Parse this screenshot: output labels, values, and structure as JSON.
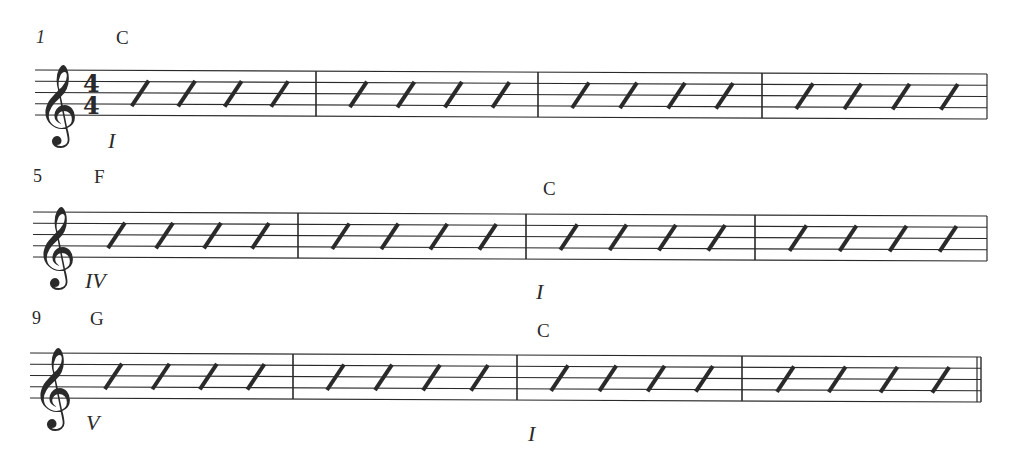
{
  "score": {
    "time_signature": {
      "top": "4",
      "bottom": "4"
    },
    "clef": "treble",
    "notation": "slash",
    "beats_per_measure": 4,
    "ink_color": "#2a2a2a",
    "systems": [
      {
        "measure_number": "1",
        "measure_number_italic": true,
        "show_time_signature": true,
        "staff_top_left": 70,
        "staff_top_right": 74,
        "staff_left": 35,
        "staff_right": 987,
        "barlines": [
          316,
          538,
          762
        ],
        "end_barline": "single",
        "chords": [
          {
            "label": "C",
            "x": 116,
            "y": 28
          }
        ],
        "romans": [
          {
            "label": "I",
            "x": 108,
            "y": 130
          }
        ],
        "measure_number_pos": {
          "x": 36,
          "y": 28
        }
      },
      {
        "measure_number": "5",
        "measure_number_italic": false,
        "show_time_signature": false,
        "staff_top_left": 212,
        "staff_top_right": 216,
        "staff_left": 33,
        "staff_right": 987,
        "barlines": [
          298,
          526,
          755
        ],
        "end_barline": "single",
        "chords": [
          {
            "label": "F",
            "x": 94,
            "y": 167
          },
          {
            "label": "C",
            "x": 543,
            "y": 179
          }
        ],
        "romans": [
          {
            "label": "IV",
            "x": 85,
            "y": 270
          },
          {
            "label": "I",
            "x": 536,
            "y": 281
          }
        ],
        "measure_number_pos": {
          "x": 33,
          "y": 167
        }
      },
      {
        "measure_number": "9",
        "measure_number_italic": false,
        "show_time_signature": false,
        "staff_top_left": 353,
        "staff_top_right": 357,
        "staff_left": 30,
        "staff_right": 981,
        "barlines": [
          293,
          517,
          742
        ],
        "end_barline": "final",
        "chords": [
          {
            "label": "G",
            "x": 90,
            "y": 309
          },
          {
            "label": "C",
            "x": 537,
            "y": 321
          }
        ],
        "romans": [
          {
            "label": "V",
            "x": 86,
            "y": 412
          },
          {
            "label": "I",
            "x": 528,
            "y": 423
          }
        ],
        "measure_number_pos": {
          "x": 32,
          "y": 309
        }
      }
    ]
  }
}
